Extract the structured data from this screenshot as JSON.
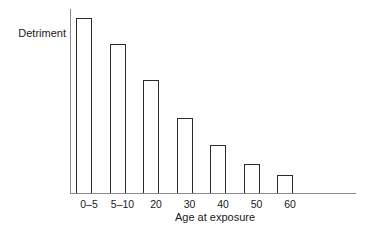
{
  "chart_data": {
    "type": "bar",
    "title": "",
    "subtitle": "",
    "xlabel": "Age at exposure",
    "ylabel": "Detriment",
    "categories": [
      "0–5",
      "5–10",
      "20",
      "30",
      "40",
      "50",
      "60"
    ],
    "values": [
      100,
      85,
      65,
      43,
      28,
      17,
      11
    ],
    "ylim": [
      0,
      100
    ],
    "xlim_note": "axis extends beyond last bar",
    "grid": false,
    "legend": null,
    "annotations": [],
    "axis_tick_labels_visible": true,
    "y_tick_labels": [],
    "series": [
      {
        "name": "Detriment",
        "values": [
          100,
          85,
          65,
          43,
          28,
          17,
          11
        ]
      }
    ],
    "colors": {
      "bar_fill": "#ffffff",
      "bar_outline": "#2b2b2b",
      "axis": "#8a8a8a",
      "text": "#1a1a1a",
      "background": "#ffffff"
    }
  }
}
